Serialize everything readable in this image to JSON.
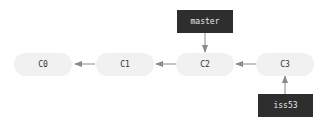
{
  "diagram": {
    "type": "git-branch-graph",
    "commits": [
      {
        "id": "C0",
        "label": "C0"
      },
      {
        "id": "C1",
        "label": "C1"
      },
      {
        "id": "C2",
        "label": "C2"
      },
      {
        "id": "C3",
        "label": "C3"
      }
    ],
    "refs": [
      {
        "name": "master",
        "label": "master",
        "points_to": "C2"
      },
      {
        "name": "iss53",
        "label": "iss53",
        "points_to": "C3"
      }
    ],
    "edges": [
      {
        "from": "C1",
        "to": "C0"
      },
      {
        "from": "C2",
        "to": "C1"
      },
      {
        "from": "C3",
        "to": "C2"
      },
      {
        "from": "master",
        "to": "C2"
      },
      {
        "from": "iss53",
        "to": "C3"
      }
    ],
    "colors": {
      "commit_fill": "#f1f1f1",
      "commit_text": "#333333",
      "ref_fill": "#2e2e2e",
      "ref_text": "#e8e8e8",
      "arrow": "#8a8a8a"
    }
  }
}
